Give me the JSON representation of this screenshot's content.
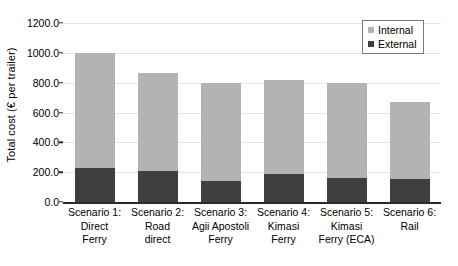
{
  "chart_data": {
    "type": "bar",
    "subtype": "stacked-vertical",
    "title": "",
    "xlabel": "",
    "ylabel": "Total cost (€ per trailer)",
    "ylim": [
      0.0,
      1200.0
    ],
    "ytick_step": 200.0,
    "ytick_labels": [
      "1200.0",
      "1000.0",
      "800.0",
      "600.0",
      "400.0",
      "200.0",
      "0.0"
    ],
    "ytick_values": [
      1200.0,
      1000.0,
      800.0,
      600.0,
      400.0,
      200.0,
      0.0
    ],
    "grid": true,
    "grid_axis": "y",
    "legend_position": "top-right",
    "categories": [
      "Scenario 1: Direct Ferry",
      "Scenario 2: Road direct",
      "Scenario 3: Agii Apostoli Ferry",
      "Scenario 4: Kimasi Ferry",
      "Scenario 5: Kimasi Ferry (ECA)",
      "Scenario 6: Rail"
    ],
    "category_lines": [
      [
        "Scenario 1:",
        "Direct",
        "Ferry"
      ],
      [
        "Scenario 2:",
        "Road",
        "direct"
      ],
      [
        "Scenario 3:",
        "Agii Apostoli",
        "Ferry"
      ],
      [
        "Scenario 4:",
        "Kimasi",
        "Ferry"
      ],
      [
        "Scenario 5:",
        "Kimasi",
        "Ferry (ECA)"
      ],
      [
        "Scenario 6:",
        "Rail",
        ""
      ]
    ],
    "series": [
      {
        "name": "External",
        "color": "#3f3f3f",
        "values": [
          230,
          208,
          140,
          185,
          158,
          155
        ]
      },
      {
        "name": "Internal",
        "color": "#b3b3b3",
        "values": [
          770,
          657,
          660,
          635,
          642,
          515
        ]
      }
    ],
    "totals": [
      1000,
      865,
      800,
      820,
      800,
      670
    ]
  },
  "legend": {
    "entries": [
      {
        "label": "Internal",
        "color": "#b3b3b3"
      },
      {
        "label": "External",
        "color": "#3f3f3f"
      }
    ]
  },
  "axis": {
    "line_color": "#2b2b2b",
    "grid_color": "#e4e4e4"
  }
}
